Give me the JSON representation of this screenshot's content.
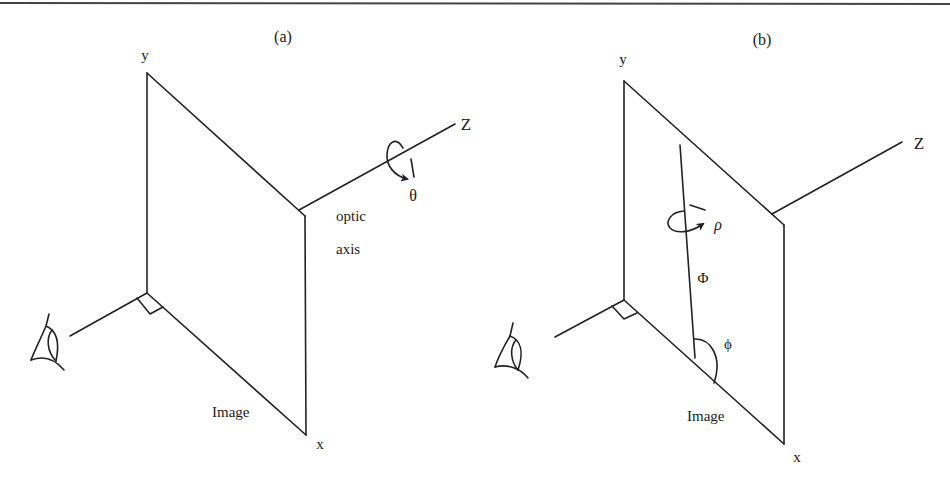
{
  "figure": {
    "top_rule": true,
    "panels": [
      {
        "id": "a",
        "caption": "(a)",
        "y_label": "y",
        "x_label": "x",
        "z_label": "Z",
        "plane_label": "Image",
        "optic_label_line1": "optic",
        "optic_label_line2": "axis",
        "rotation_label": "θ"
      },
      {
        "id": "b",
        "caption": "(b)",
        "y_label": "y",
        "x_label": "x",
        "z_label": "Z",
        "plane_label": "Image",
        "line_label": "Φ",
        "angle_label": "ϕ",
        "rotation_label": "ρ"
      }
    ]
  }
}
